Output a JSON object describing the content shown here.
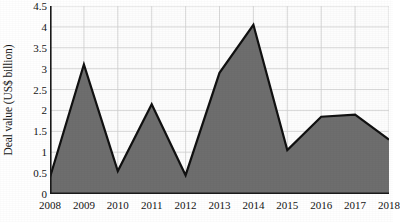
{
  "chart_data": {
    "type": "area",
    "title": "",
    "xlabel": "",
    "ylabel": "Deal value (US$ billion)",
    "categories": [
      "2008",
      "2009",
      "2010",
      "2011",
      "2012",
      "2013",
      "2014",
      "2015",
      "2016",
      "2017",
      "2018"
    ],
    "values": [
      0.4,
      3.1,
      0.55,
      2.15,
      0.45,
      2.9,
      4.05,
      1.05,
      1.85,
      1.9,
      1.3
    ],
    "series": [
      {
        "name": "Deal value",
        "values": [
          0.4,
          3.1,
          0.55,
          2.15,
          0.45,
          2.9,
          4.05,
          1.05,
          1.85,
          1.9,
          1.3
        ]
      }
    ],
    "ylim": [
      0,
      4.5
    ],
    "ytick_values": [
      0,
      0.5,
      1,
      1.5,
      2,
      2.5,
      3,
      3.5,
      4,
      4.5
    ],
    "ytick_labels": [
      "0",
      "0.5",
      "1",
      "1.5",
      "2",
      "2.5",
      "3",
      "3.5",
      "4",
      "4.5"
    ],
    "grid": true,
    "legend": "none",
    "colors": {
      "area_fill": "#6e6e6e",
      "area_line": "#111111",
      "grid_line": "#cfcfcf",
      "axis_line": "#1a1a1a",
      "plot_background": "#fdfdfd",
      "text": "#141414"
    }
  }
}
